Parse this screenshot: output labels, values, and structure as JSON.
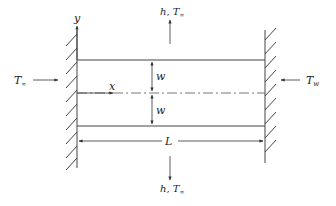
{
  "diagram": {
    "type": "fin/plate heat transfer schematic",
    "walls": [
      {
        "name": "left-wall",
        "x": 77,
        "y_top": 30,
        "y_bottom": 168,
        "hatch_side": "left"
      },
      {
        "name": "right-wall",
        "x": 265,
        "y_top": 30,
        "y_bottom": 163,
        "hatch_side": "right"
      }
    ],
    "plate": {
      "x_start": 77,
      "x_end": 265,
      "y_top": 60,
      "y_center": 93,
      "y_bottom": 126
    },
    "labels": {
      "y_axis": "y",
      "x_axis": "x",
      "half_width_top": "w",
      "half_width_bottom": "w",
      "length": "L",
      "top_convection_h": "h, T",
      "top_convection_sub": "∞",
      "bottom_convection_h": "h, T",
      "bottom_convection_sub": "∞",
      "left_temp": "T",
      "left_temp_sub": "∞",
      "right_temp": "T",
      "right_temp_sub": "w"
    },
    "colors": {
      "line": "#333333",
      "text": "#222222",
      "background": "#ffffff"
    }
  }
}
